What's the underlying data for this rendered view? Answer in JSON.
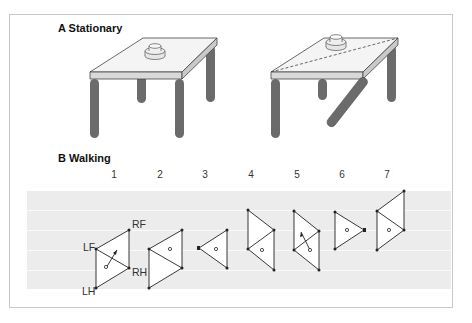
{
  "panel_a": {
    "label": "A  Stationary"
  },
  "panel_b": {
    "label": "B  Walking",
    "steps": [
      "1",
      "2",
      "3",
      "4",
      "5",
      "6",
      "7"
    ],
    "leg_labels": {
      "rf": "RF",
      "lf": "LF",
      "rh": "RH",
      "lh": "LH"
    }
  },
  "colors": {
    "frame": "#c8c8c8",
    "table_top": "#f4f4f4",
    "table_edge": "#d9d9d9",
    "leg": "#6b6b6b",
    "stripe_band": "#ececec",
    "stripe_line": "#fafafa",
    "ink": "#222222"
  }
}
